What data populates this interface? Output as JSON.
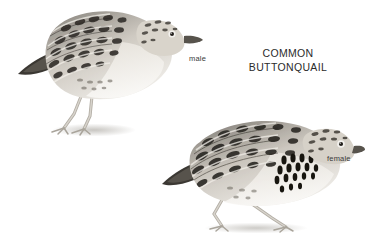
{
  "plate": {
    "background_color": "#ffffff",
    "title_color": "#2b2b2b",
    "label_color": "#3a3a3a",
    "species_title_line1": "COMMON",
    "species_title_line2": "BUTTONQUAIL"
  },
  "figures": [
    {
      "id": "male",
      "label": "male",
      "icon": "bird-illustration",
      "posture": "standing upright, facing right",
      "plumage": "dark scalloped chevrons on back and wings, pale buff underparts, fine crown streaking, pale eye with dark pupil, slender pale legs"
    },
    {
      "id": "female",
      "label": "female",
      "icon": "bird-illustration",
      "posture": "crouched horizontal, facing right",
      "plumage": "bold black teardrop spots on breast side, heavy dark barring on back and wings, pale eye with dark pupil, slender pale legs, rear leg extended back"
    }
  ]
}
